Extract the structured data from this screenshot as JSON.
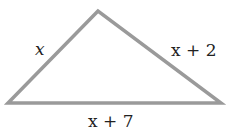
{
  "diagram": {
    "shape": "triangle",
    "stroke_color": "#9a9a9a",
    "sides": {
      "left": "x",
      "right": "x + 2",
      "bottom": "x + 7"
    }
  }
}
